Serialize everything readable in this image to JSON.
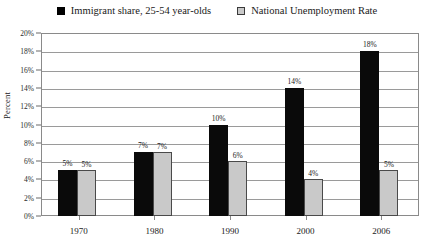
{
  "chart_data": {
    "type": "bar",
    "title": "",
    "subtitle": "",
    "xlabel": "",
    "ylabel": "Percent",
    "categories": [
      "1970",
      "1980",
      "1990",
      "2000",
      "2006"
    ],
    "series": [
      {
        "name": "Immigrant share, 25-54 year-olds",
        "color": "#000000",
        "values": [
          5,
          7,
          10,
          14,
          18
        ],
        "labels": [
          "5%",
          "7%",
          "10%",
          "14%",
          "18%"
        ]
      },
      {
        "name": "National Unemployment Rate",
        "color": "#c9c9c9",
        "values": [
          5,
          7,
          6,
          4,
          5
        ],
        "labels": [
          "5%",
          "7%",
          "6%",
          "4%",
          "5%"
        ]
      }
    ],
    "ylim": [
      0,
      20
    ],
    "ytick_values": [
      0,
      2,
      4,
      6,
      8,
      10,
      12,
      14,
      16,
      18,
      20
    ],
    "ytick_labels": [
      "0%",
      "2%",
      "4%",
      "6%",
      "8%",
      "10%",
      "12%",
      "14%",
      "16%",
      "18%",
      "20%"
    ],
    "grid": true,
    "legend_position": "top-center",
    "value_labels_shown": true
  },
  "legend": {
    "entries": [
      {
        "label": "Immigrant share, 25-54 year-olds",
        "marker": "filled-square-black"
      },
      {
        "label": "National Unemployment Rate",
        "marker": "outlined-square-gray"
      }
    ]
  },
  "axes": {
    "y_title": "Percent"
  }
}
